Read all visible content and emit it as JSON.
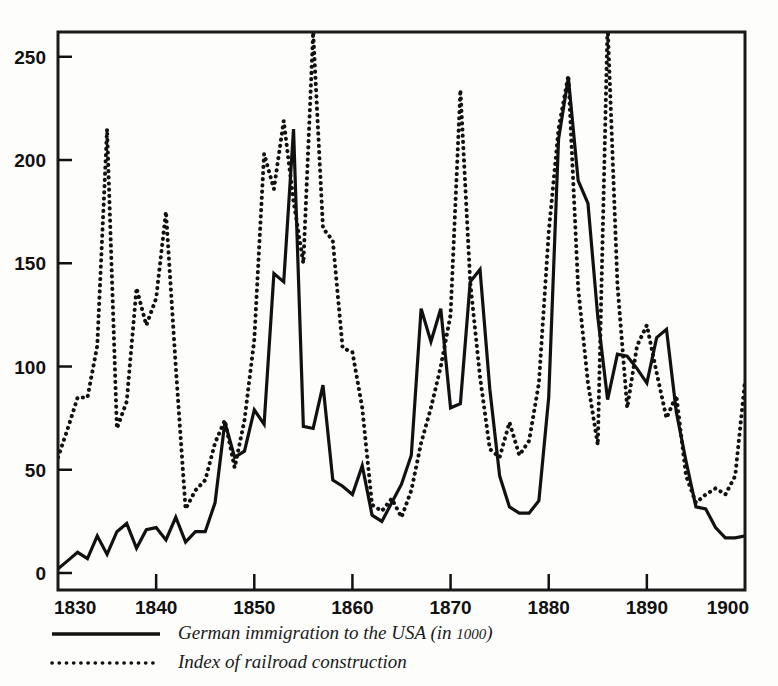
{
  "chart_data": {
    "type": "line",
    "title": "",
    "subtitle": "",
    "xlabel": "",
    "ylabel": "",
    "xlim": [
      1830,
      1900
    ],
    "ylim": [
      0,
      262
    ],
    "grid": false,
    "legend_position": "below-left",
    "x_ticks": [
      "1830",
      "1840",
      "1850",
      "1860",
      "1870",
      "1880",
      "1890",
      "1900"
    ],
    "x_tick_values": [
      1830,
      1840,
      1850,
      1860,
      1870,
      1880,
      1890,
      1900
    ],
    "y_ticks": [
      "0",
      "50",
      "100",
      "150",
      "200",
      "250"
    ],
    "y_tick_values": [
      0,
      50,
      100,
      150,
      200,
      250
    ],
    "series": [
      {
        "name": "German immigration to the USA (in 1000)",
        "style": "solid",
        "color": "#111111",
        "x": [
          1830,
          1831,
          1832,
          1833,
          1834,
          1835,
          1836,
          1837,
          1838,
          1839,
          1840,
          1841,
          1842,
          1843,
          1844,
          1845,
          1846,
          1847,
          1848,
          1849,
          1850,
          1851,
          1852,
          1853,
          1854,
          1855,
          1856,
          1857,
          1858,
          1859,
          1860,
          1861,
          1862,
          1863,
          1864,
          1865,
          1866,
          1867,
          1868,
          1869,
          1870,
          1871,
          1872,
          1873,
          1874,
          1875,
          1876,
          1877,
          1878,
          1879,
          1880,
          1881,
          1882,
          1883,
          1884,
          1885,
          1886,
          1887,
          1888,
          1889,
          1890,
          1891,
          1892,
          1893,
          1894,
          1895,
          1896,
          1897,
          1898,
          1899,
          1900
        ],
        "values": [
          2,
          6,
          10,
          7,
          18,
          9,
          20,
          24,
          12,
          21,
          22,
          16,
          27,
          15,
          20,
          20,
          34,
          73,
          56,
          59,
          79,
          72,
          145,
          141,
          215,
          71,
          70,
          91,
          45,
          42,
          38,
          52,
          28,
          25,
          34,
          43,
          57,
          128,
          112,
          128,
          80,
          82,
          141,
          147,
          89,
          47,
          32,
          29,
          29,
          35,
          85,
          210,
          240,
          190,
          179,
          124,
          84,
          106,
          105,
          99,
          92,
          114,
          118,
          78,
          54,
          32,
          31,
          22,
          17,
          17,
          18
        ]
      },
      {
        "name": "Index of railroad construction",
        "style": "dotted",
        "color": "#111111",
        "x": [
          1830,
          1831,
          1832,
          1833,
          1834,
          1835,
          1836,
          1837,
          1838,
          1839,
          1840,
          1841,
          1842,
          1843,
          1844,
          1845,
          1846,
          1847,
          1848,
          1849,
          1850,
          1851,
          1852,
          1853,
          1854,
          1855,
          1856,
          1857,
          1858,
          1859,
          1860,
          1861,
          1862,
          1863,
          1864,
          1865,
          1866,
          1867,
          1868,
          1869,
          1870,
          1871,
          1872,
          1873,
          1874,
          1875,
          1876,
          1877,
          1878,
          1879,
          1880,
          1881,
          1882,
          1883,
          1884,
          1885,
          1886,
          1887,
          1888,
          1889,
          1890,
          1891,
          1892,
          1893,
          1894,
          1895,
          1896,
          1897,
          1898,
          1899,
          1900
        ],
        "values": [
          56,
          70,
          85,
          85,
          110,
          215,
          70,
          83,
          138,
          120,
          133,
          175,
          100,
          31,
          40,
          45,
          63,
          74,
          51,
          74,
          113,
          203,
          186,
          219,
          180,
          150,
          262,
          167,
          161,
          109,
          107,
          80,
          33,
          30,
          36,
          27,
          40,
          63,
          80,
          100,
          125,
          234,
          141,
          95,
          60,
          56,
          73,
          57,
          64,
          92,
          165,
          215,
          241,
          138,
          92,
          62,
          266,
          140,
          80,
          110,
          120,
          97,
          75,
          86,
          47,
          34,
          38,
          41,
          38,
          47,
          93
        ]
      }
    ]
  },
  "legend": {
    "items": [
      {
        "label": "German immigration to the USA (in 1000)",
        "label_main": "German immigration to the USA (in ",
        "label_small": "1000",
        "label_end": ")",
        "style": "solid"
      },
      {
        "label": "Index of railroad construction",
        "label_main": "Index of railroad construction",
        "label_small": "",
        "label_end": "",
        "style": "dotted"
      }
    ]
  },
  "colors": {
    "ink": "#111111",
    "paper": "#fdfdfc",
    "frame": "#1a1a1a"
  }
}
